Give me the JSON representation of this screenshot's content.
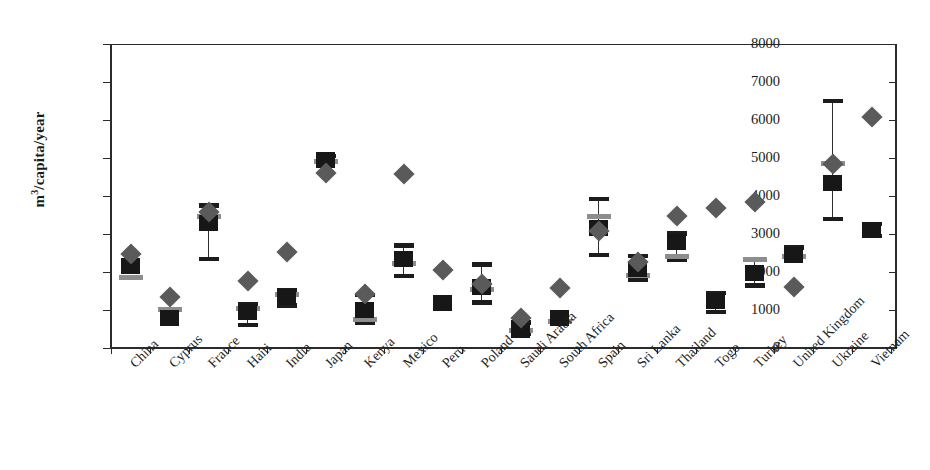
{
  "chart_data": {
    "type": "scatter",
    "title": "",
    "xlabel": "",
    "ylabel": "m3/capita/year",
    "ylabel_html": "m<sup>3</sup>/capita/year",
    "ylim": [
      0,
      8000
    ],
    "ytick_values": [
      0,
      1000,
      2000,
      3000,
      4000,
      5000,
      6000,
      7000,
      8000
    ],
    "ytick_labels": [
      "0",
      "1000",
      "2000",
      "3000",
      "4000",
      "5000",
      "6000",
      "7000",
      "8000"
    ],
    "grid": false,
    "legend": "none",
    "categories": [
      "China",
      "Cyprus",
      "France",
      "Haiti",
      "India",
      "Japan",
      "Kenya",
      "Mexico",
      "Peru",
      "Poland",
      "Saudi Arabia",
      "South Africa",
      "Spain",
      "Sri Lanka",
      "Thailand",
      "Togo",
      "Turkey",
      "United Kingdom",
      "Ukraine",
      "Vietnam"
    ],
    "series": [
      {
        "name": "diamond-marker",
        "marker": "diamond",
        "color": "#5a5a5a",
        "values": [
          2480,
          1340,
          3580,
          1760,
          2530,
          4600,
          1430,
          4570,
          2040,
          1680,
          800,
          1590,
          3080,
          2270,
          3480,
          3680,
          3830,
          1600,
          4850,
          6080
        ]
      },
      {
        "name": "square-marker",
        "marker": "square",
        "color": "#171717",
        "values": [
          2150,
          790,
          3280,
          950,
          1350,
          4950,
          1000,
          2350,
          1180,
          1600,
          480,
          790,
          3150,
          2080,
          2800,
          1250,
          1980,
          2450,
          4350,
          3100
        ],
        "error_low": [
          null,
          null,
          2350,
          600,
          1120,
          null,
          650,
          1900,
          null,
          1200,
          370,
          null,
          2450,
          1800,
          2330,
          950,
          1640,
          null,
          3400,
          2950
        ],
        "error_high": [
          null,
          null,
          3750,
          1160,
          1520,
          5050,
          1400,
          2700,
          null,
          2200,
          670,
          null,
          3920,
          2420,
          3010,
          1450,
          2350,
          2640,
          6500,
          3260
        ]
      },
      {
        "name": "gray-dash-marker",
        "marker": "dash",
        "color": "#8d8d8d",
        "values": [
          1850,
          1020,
          3450,
          1030,
          1400,
          4900,
          740,
          2230,
          null,
          1540,
          450,
          690,
          3450,
          1900,
          2420,
          null,
          2330,
          2420,
          4850,
          null
        ]
      }
    ]
  }
}
